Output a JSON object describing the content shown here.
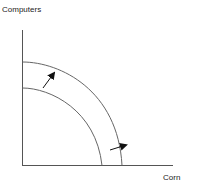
{
  "diagram": {
    "y_axis_label": "Computers",
    "x_axis_label": "Corn",
    "curves": [
      {
        "name": "original-ppf",
        "description": "Inner curve"
      },
      {
        "name": "shifted-ppf",
        "description": "Outer curve"
      }
    ],
    "arrows": [
      {
        "name": "shift-arrow-upper",
        "direction": "outward (up-right)"
      },
      {
        "name": "shift-arrow-lower",
        "direction": "outward (right)"
      }
    ],
    "colors": {
      "axis": "#555555",
      "curve": "#666666",
      "arrow": "#111111",
      "text": "#222222"
    }
  }
}
